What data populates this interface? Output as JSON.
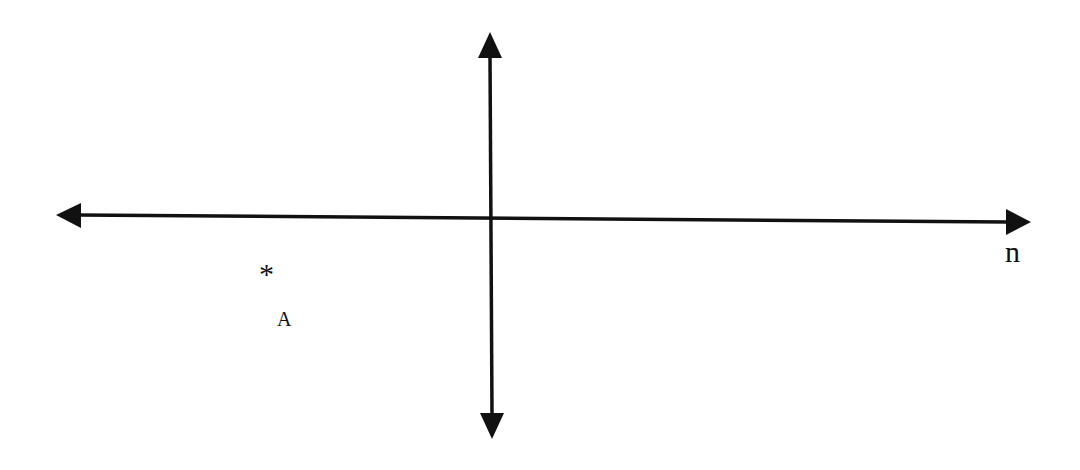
{
  "diagram": {
    "type": "coordinate-axes",
    "horizontal_axis": {
      "label": "n",
      "arrows": "both"
    },
    "vertical_axis": {
      "label": "",
      "arrows": "both"
    },
    "point": {
      "marker": "*",
      "label": "A"
    },
    "colors": {
      "line": "#111111",
      "background": "#ffffff"
    }
  }
}
